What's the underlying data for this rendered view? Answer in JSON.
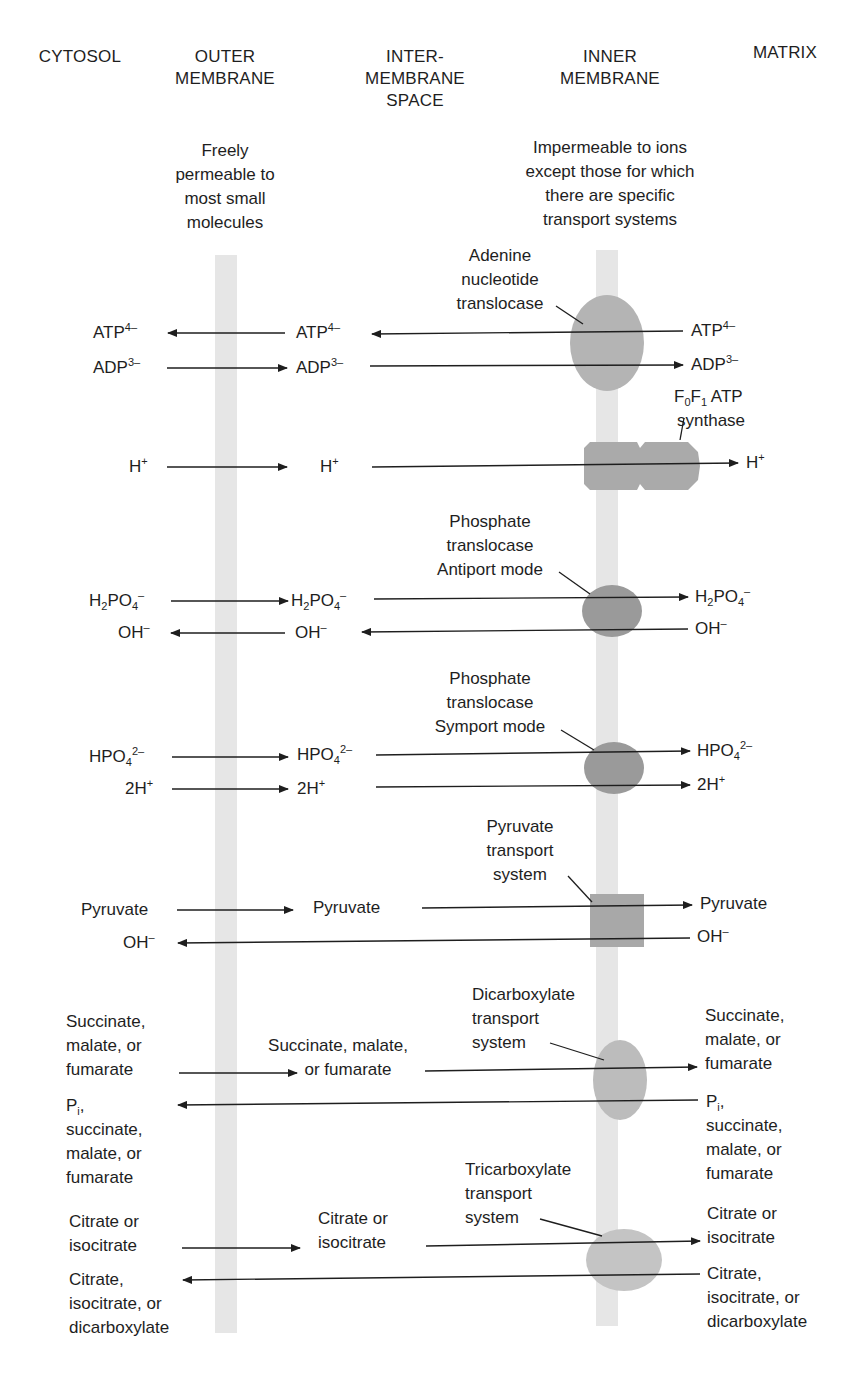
{
  "headers": {
    "cytosol": "CYTOSOL",
    "outer_membrane": [
      "OUTER",
      "MEMBRANE"
    ],
    "intermembrane_space": [
      "INTER-",
      "MEMBRANE",
      "SPACE"
    ],
    "inner_membrane": [
      "INNER",
      "MEMBRANE"
    ],
    "matrix": "MATRIX"
  },
  "notes": {
    "outer": [
      "Freely",
      "permeable to",
      "most small",
      "molecules"
    ],
    "inner": [
      "Impermeable to ions",
      "except those for which",
      "there are specific",
      "transport systems"
    ]
  },
  "transporters": {
    "adenine": [
      "Adenine",
      "nucleotide",
      "translocase"
    ],
    "atp_synthase": [
      "ATP",
      "synthase"
    ],
    "atp_synthase_sub": {
      "f": "F",
      "s0": "0",
      "s1": "1"
    },
    "phosphate_antiport": [
      "Phosphate",
      "translocase",
      "Antiport mode"
    ],
    "phosphate_symport": [
      "Phosphate",
      "translocase",
      "Symport mode"
    ],
    "pyruvate": [
      "Pyruvate",
      "transport",
      "system"
    ],
    "dicarboxylate": [
      "Dicarboxylate",
      "transport",
      "system"
    ],
    "tricarboxylate": [
      "Tricarboxylate",
      "transport",
      "system"
    ]
  },
  "species": {
    "atp": {
      "base": "ATP",
      "charge": "4–"
    },
    "adp": {
      "base": "ADP",
      "charge": "3–"
    },
    "h": {
      "base": "H",
      "charge": "+"
    },
    "h2po4": {
      "h": "H",
      "sub2": "2",
      "po": "PO",
      "sub4": "4",
      "charge": "–"
    },
    "oh": {
      "base": "OH",
      "charge": "–"
    },
    "hpo4": {
      "base": "HPO",
      "sub4": "4",
      "charge": "2–"
    },
    "two_h": {
      "base": "2H",
      "charge": "+"
    },
    "pyruvate": "Pyruvate",
    "succ_left": [
      "Succinate,",
      "malate, or",
      "fumarate"
    ],
    "succ_mid": [
      "Succinate, malate,",
      "or fumarate"
    ],
    "succ_right": [
      "Succinate,",
      "malate, or",
      "fumarate"
    ],
    "pi": {
      "base": "P",
      "sub": "i",
      "tail": ","
    },
    "pi_rest": [
      "succinate,",
      "malate, or",
      "fumarate"
    ],
    "citrate_left": [
      "Citrate or",
      "isocitrate"
    ],
    "citrate_mid": [
      "Citrate or",
      "isocitrate"
    ],
    "citrate_right": [
      "Citrate or",
      "isocitrate"
    ],
    "citrate_out": [
      "Citrate,",
      "isocitrate, or",
      "dicarboxylate"
    ]
  },
  "colors": {
    "membrane": "#e6e6e6",
    "transporter_light": "#bdbdbd",
    "transporter_dark": "#9e9e9e",
    "ink": "#1e1e1e"
  }
}
